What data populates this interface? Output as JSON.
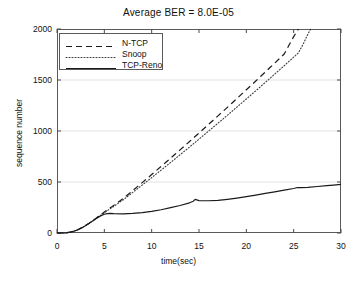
{
  "chart_data": {
    "type": "line",
    "title": "Average BER = 8.0E-05",
    "xlabel": "time(sec)",
    "ylabel": "sequence number",
    "xlim": [
      0,
      30
    ],
    "ylim": [
      0,
      2000
    ],
    "xticks": [
      0,
      5,
      10,
      15,
      20,
      25,
      30
    ],
    "yticks": [
      0,
      500,
      1000,
      1500,
      2000
    ],
    "grid": "horizontal-faint",
    "legend_position": "top-left-inside",
    "series": [
      {
        "name": "N-TCP",
        "style": "dashed",
        "color": "#1a1a1a",
        "x": [
          0,
          0.6,
          1.0,
          1.4,
          1.8,
          2.2,
          2.6,
          3.0,
          3.4,
          3.8,
          4.2,
          4.6,
          5.0,
          5.4,
          5.8,
          6.2,
          6.6,
          7.0,
          7.5,
          8.0,
          8.5,
          9.0,
          9.5,
          10.0,
          10.5,
          11.0,
          11.5,
          12.0,
          12.5,
          13.0,
          13.5,
          14.0,
          14.5,
          15.0,
          15.5,
          16.0,
          16.5,
          17.0,
          17.5,
          18.0,
          18.5,
          19.0,
          19.5,
          20.0,
          20.5,
          21.0,
          21.5,
          22.0,
          22.5,
          23.0,
          23.5,
          24.0,
          24.5,
          25.0,
          25.5
        ],
        "y": [
          0,
          0,
          2,
          8,
          18,
          32,
          50,
          72,
          96,
          122,
          150,
          178,
          205,
          232,
          258,
          285,
          312,
          340,
          378,
          416,
          455,
          494,
          533,
          573,
          613,
          653,
          693,
          733,
          774,
          815,
          856,
          897,
          938,
          980,
          1022,
          1064,
          1106,
          1148,
          1190,
          1232,
          1275,
          1318,
          1361,
          1404,
          1447,
          1490,
          1534,
          1578,
          1622,
          1666,
          1710,
          1755,
          1840,
          1925,
          2000
        ]
      },
      {
        "name": "Snoop",
        "style": "dotted",
        "color": "#3a3a3a",
        "x": [
          0,
          0.6,
          1.0,
          1.4,
          1.8,
          2.2,
          2.6,
          3.0,
          3.4,
          3.8,
          4.2,
          4.6,
          5.0,
          5.4,
          5.8,
          6.2,
          6.6,
          7.0,
          7.5,
          8.0,
          8.5,
          9.0,
          9.5,
          10.0,
          10.5,
          11.0,
          11.5,
          12.0,
          12.5,
          13.0,
          13.5,
          14.0,
          14.5,
          15.0,
          15.5,
          16.0,
          16.5,
          17.0,
          17.5,
          18.0,
          18.5,
          19.0,
          19.5,
          20.0,
          20.5,
          21.0,
          21.5,
          22.0,
          22.5,
          23.0,
          23.5,
          24.0,
          24.5,
          25.0,
          25.5,
          26.0,
          26.5,
          26.8
        ],
        "y": [
          0,
          0,
          2,
          8,
          18,
          32,
          50,
          72,
          96,
          120,
          146,
          172,
          198,
          224,
          249,
          274,
          300,
          326,
          362,
          398,
          434,
          470,
          506,
          543,
          580,
          617,
          654,
          691,
          729,
          767,
          805,
          843,
          881,
          920,
          959,
          998,
          1037,
          1076,
          1115,
          1154,
          1194,
          1234,
          1274,
          1314,
          1354,
          1394,
          1435,
          1476,
          1517,
          1558,
          1599,
          1640,
          1682,
          1724,
          1766,
          1850,
          1950,
          2000
        ]
      },
      {
        "name": "TCP-Reno",
        "style": "solid",
        "color": "#1a1a1a",
        "x": [
          0,
          0.6,
          1.0,
          1.4,
          1.8,
          2.2,
          2.6,
          3.0,
          3.4,
          3.8,
          4.2,
          4.6,
          5.0,
          5.3,
          5.6,
          6.0,
          7.0,
          8.0,
          9.0,
          10.0,
          11.0,
          12.0,
          13.0,
          14.0,
          14.4,
          14.6,
          15.0,
          16.0,
          17.0,
          18.0,
          19.0,
          20.0,
          21.0,
          22.0,
          23.0,
          24.0,
          25.0,
          25.4,
          25.8,
          26.5,
          27.5,
          28.5,
          29.2,
          30.0
        ],
        "y": [
          0,
          0,
          2,
          8,
          18,
          32,
          50,
          72,
          96,
          120,
          146,
          168,
          184,
          190,
          192,
          190,
          188,
          192,
          200,
          212,
          228,
          248,
          270,
          296,
          312,
          330,
          318,
          316,
          320,
          330,
          342,
          356,
          372,
          388,
          404,
          420,
          436,
          446,
          444,
          448,
          456,
          464,
          470,
          476
        ]
      }
    ]
  }
}
